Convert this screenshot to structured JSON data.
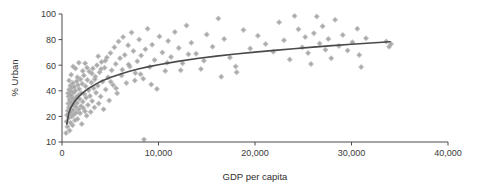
{
  "chart_data": {
    "type": "scatter",
    "title": "",
    "xlabel": "GDP per capita",
    "ylabel": "% Urban",
    "xlim": [
      0,
      40000
    ],
    "ylim": [
      10,
      100
    ],
    "grid": false,
    "legend": null,
    "xticks": [
      0,
      10000,
      20000,
      30000,
      40000
    ],
    "xticklabels": [
      "0",
      "10,000",
      "20,000",
      "30,000",
      "40,000"
    ],
    "yticks": [
      10,
      20,
      40,
      60,
      80,
      100
    ],
    "yticklabels": [
      "10",
      "20",
      "40",
      "60",
      "80",
      "100"
    ],
    "y_axis_note": "tick 10 placed one even step below 20; spacing 10-20 equals 20-40",
    "marker_color": "#b4b4b4",
    "marker_shape": "plus-diamond",
    "marker_size": 3,
    "axis_color": "#4a4a4a",
    "trendline": {
      "label": "logarithmic fit",
      "color": "#4a4a4a",
      "width": 1.6,
      "points": [
        [
          500,
          17.0
        ],
        [
          700,
          22.5
        ],
        [
          900,
          26.5
        ],
        [
          1200,
          30.5
        ],
        [
          1500,
          33.5
        ],
        [
          2000,
          37.5
        ],
        [
          2500,
          40.5
        ],
        [
          3000,
          43.0
        ],
        [
          3500,
          45.2
        ],
        [
          4000,
          47.2
        ],
        [
          5000,
          50.3
        ],
        [
          6000,
          53.0
        ],
        [
          7000,
          55.3
        ],
        [
          8000,
          57.2
        ],
        [
          9000,
          58.9
        ],
        [
          10000,
          60.4
        ],
        [
          12000,
          63.0
        ],
        [
          14000,
          65.2
        ],
        [
          16000,
          67.1
        ],
        [
          18000,
          68.7
        ],
        [
          20000,
          70.2
        ],
        [
          22000,
          71.6
        ],
        [
          24000,
          72.9
        ],
        [
          26000,
          74.1
        ],
        [
          28000,
          75.3
        ],
        [
          30000,
          76.4
        ],
        [
          32000,
          77.4
        ],
        [
          34000,
          78.3
        ]
      ]
    },
    "points": [
      [
        420,
        13.5
      ],
      [
        470,
        18.0
      ],
      [
        520,
        21.0
      ],
      [
        560,
        16.0
      ],
      [
        600,
        24.5
      ],
      [
        620,
        38.0
      ],
      [
        650,
        30.0
      ],
      [
        680,
        35.5
      ],
      [
        700,
        19.5
      ],
      [
        720,
        27.0
      ],
      [
        740,
        41.0
      ],
      [
        760,
        22.0
      ],
      [
        780,
        33.0
      ],
      [
        800,
        14.5
      ],
      [
        820,
        37.0
      ],
      [
        850,
        26.0
      ],
      [
        870,
        44.0
      ],
      [
        890,
        17.5
      ],
      [
        910,
        31.0
      ],
      [
        930,
        39.5
      ],
      [
        960,
        23.5
      ],
      [
        980,
        36.0
      ],
      [
        1000,
        28.5
      ],
      [
        1020,
        20.0
      ],
      [
        1050,
        42.5
      ],
      [
        1080,
        34.0
      ],
      [
        1100,
        16.5
      ],
      [
        1130,
        46.0
      ],
      [
        1160,
        25.0
      ],
      [
        1190,
        38.5
      ],
      [
        1220,
        29.5
      ],
      [
        1250,
        21.5
      ],
      [
        1280,
        43.0
      ],
      [
        1310,
        32.5
      ],
      [
        1340,
        18.5
      ],
      [
        1380,
        40.0
      ],
      [
        1420,
        27.5
      ],
      [
        1450,
        35.0
      ],
      [
        1490,
        23.0
      ],
      [
        1530,
        47.5
      ],
      [
        1570,
        30.5
      ],
      [
        1610,
        19.0
      ],
      [
        1650,
        44.5
      ],
      [
        1690,
        36.5
      ],
      [
        1730,
        25.5
      ],
      [
        1780,
        41.5
      ],
      [
        1820,
        33.5
      ],
      [
        1870,
        22.5
      ],
      [
        1910,
        49.0
      ],
      [
        1960,
        28.0
      ],
      [
        2000,
        38.0
      ],
      [
        2050,
        17.0
      ],
      [
        2100,
        45.5
      ],
      [
        2160,
        31.5
      ],
      [
        2210,
        26.5
      ],
      [
        2270,
        52.0
      ],
      [
        2320,
        37.5
      ],
      [
        2380,
        24.0
      ],
      [
        2440,
        43.5
      ],
      [
        2500,
        34.5
      ],
      [
        2560,
        20.5
      ],
      [
        2630,
        48.5
      ],
      [
        2690,
        29.0
      ],
      [
        2760,
        40.5
      ],
      [
        2830,
        55.0
      ],
      [
        2900,
        36.0
      ],
      [
        2970,
        23.5
      ],
      [
        3050,
        46.5
      ],
      [
        3120,
        32.0
      ],
      [
        3200,
        57.5
      ],
      [
        3280,
        42.0
      ],
      [
        3360,
        27.0
      ],
      [
        3450,
        51.0
      ],
      [
        3530,
        38.5
      ],
      [
        3620,
        60.0
      ],
      [
        3710,
        44.0
      ],
      [
        3800,
        30.0
      ],
      [
        3900,
        54.5
      ],
      [
        4000,
        35.5
      ],
      [
        4100,
        62.5
      ],
      [
        4200,
        47.0
      ],
      [
        4310,
        25.5
      ],
      [
        4420,
        58.0
      ],
      [
        4530,
        41.0
      ],
      [
        4650,
        66.0
      ],
      [
        4770,
        50.5
      ],
      [
        4890,
        32.5
      ],
      [
        5020,
        69.5
      ],
      [
        5150,
        56.0
      ],
      [
        5290,
        44.5
      ],
      [
        5430,
        74.0
      ],
      [
        5570,
        61.0
      ],
      [
        5710,
        38.0
      ],
      [
        5860,
        78.5
      ],
      [
        6010,
        65.5
      ],
      [
        6170,
        52.0
      ],
      [
        6330,
        82.0
      ],
      [
        6500,
        68.0
      ],
      [
        6670,
        46.0
      ],
      [
        6850,
        75.5
      ],
      [
        7030,
        59.0
      ],
      [
        7210,
        85.5
      ],
      [
        7400,
        71.0
      ],
      [
        7600,
        54.0
      ],
      [
        7800,
        63.0
      ],
      [
        8000,
        80.0
      ],
      [
        8200,
        67.5
      ],
      [
        8420,
        49.5
      ],
      [
        8640,
        72.5
      ],
      [
        8500,
        11.0
      ],
      [
        8870,
        88.5
      ],
      [
        9100,
        58.5
      ],
      [
        9340,
        76.0
      ],
      [
        9590,
        64.0
      ],
      [
        9840,
        41.5
      ],
      [
        10100,
        82.5
      ],
      [
        10400,
        70.0
      ],
      [
        10700,
        55.5
      ],
      [
        11000,
        79.0
      ],
      [
        11300,
        66.5
      ],
      [
        11700,
        86.0
      ],
      [
        12100,
        73.5
      ],
      [
        12500,
        61.5
      ],
      [
        12900,
        91.0
      ],
      [
        13400,
        77.5
      ],
      [
        13900,
        69.0
      ],
      [
        14400,
        57.0
      ],
      [
        15000,
        84.0
      ],
      [
        15600,
        74.5
      ],
      [
        16200,
        96.5
      ],
      [
        16800,
        80.5
      ],
      [
        16500,
        51.0
      ],
      [
        17400,
        66.0
      ],
      [
        18100,
        54.5
      ],
      [
        18000,
        59.0
      ],
      [
        18800,
        87.5
      ],
      [
        19500,
        73.0
      ],
      [
        20300,
        83.0
      ],
      [
        21100,
        76.5
      ],
      [
        21900,
        70.5
      ],
      [
        22500,
        93.5
      ],
      [
        23000,
        79.5
      ],
      [
        23600,
        64.5
      ],
      [
        24100,
        98.5
      ],
      [
        24500,
        88.0
      ],
      [
        24900,
        74.0
      ],
      [
        25200,
        82.0
      ],
      [
        25500,
        69.5
      ],
      [
        25800,
        61.0
      ],
      [
        26100,
        85.0
      ],
      [
        26400,
        98.0
      ],
      [
        26700,
        77.0
      ],
      [
        27000,
        90.5
      ],
      [
        27300,
        72.0
      ],
      [
        27600,
        80.5
      ],
      [
        27900,
        65.5
      ],
      [
        28300,
        95.5
      ],
      [
        28700,
        75.0
      ],
      [
        29100,
        83.5
      ],
      [
        29600,
        71.5
      ],
      [
        30100,
        78.0
      ],
      [
        30600,
        88.5
      ],
      [
        31000,
        58.5
      ],
      [
        30800,
        68.0
      ],
      [
        31500,
        81.0
      ],
      [
        33600,
        78.5
      ],
      [
        33900,
        74.5
      ],
      [
        34100,
        76.5
      ],
      [
        1150,
        59.0
      ],
      [
        1400,
        57.5
      ],
      [
        1750,
        62.0
      ],
      [
        2150,
        55.5
      ],
      [
        2600,
        58.0
      ],
      [
        3100,
        53.5
      ],
      [
        3400,
        49.0
      ],
      [
        4050,
        57.0
      ],
      [
        4480,
        63.5
      ],
      [
        5050,
        47.0
      ],
      [
        5600,
        42.0
      ],
      [
        6250,
        56.5
      ],
      [
        6900,
        60.5
      ],
      [
        7550,
        48.0
      ],
      [
        8150,
        53.0
      ],
      [
        9250,
        45.0
      ],
      [
        10900,
        62.0
      ],
      [
        12300,
        56.0
      ],
      [
        13100,
        68.5
      ],
      [
        14700,
        63.5
      ],
      [
        730,
        48.0
      ],
      [
        950,
        52.5
      ],
      [
        1600,
        50.5
      ],
      [
        2400,
        61.5
      ],
      [
        3750,
        67.0
      ]
    ]
  },
  "axes": {
    "ylabel_text": "% Urban",
    "xlabel_text": "GDP per capita"
  }
}
